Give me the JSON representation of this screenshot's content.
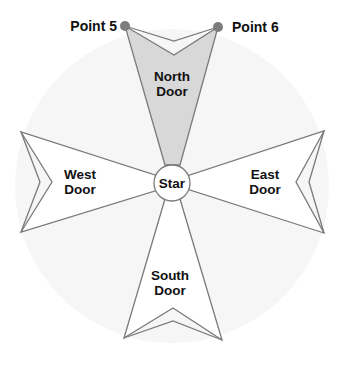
{
  "diagram": {
    "title": "",
    "colors": {
      "background_circle": "#f6f6f6",
      "outline": "#7a7a7a",
      "north_fill": "#d8d8d8",
      "door_fill": "#ffffff",
      "point_marker": "#7d7d7d",
      "text": "#111111"
    },
    "center": {
      "label": "Star",
      "x": 172,
      "y": 183,
      "r": 17
    },
    "doors": [
      {
        "id": "north",
        "line1": "North",
        "line2": "Door",
        "highlighted": true
      },
      {
        "id": "west",
        "line1": "West",
        "line2": "Door",
        "highlighted": false
      },
      {
        "id": "east",
        "line1": "East",
        "line2": "Door",
        "highlighted": false
      },
      {
        "id": "south",
        "line1": "South",
        "line2": "Door",
        "highlighted": false
      }
    ],
    "points": [
      {
        "label": "Point 5",
        "x": 125,
        "y": 26
      },
      {
        "label": "Point 6",
        "x": 218,
        "y": 27
      }
    ]
  }
}
